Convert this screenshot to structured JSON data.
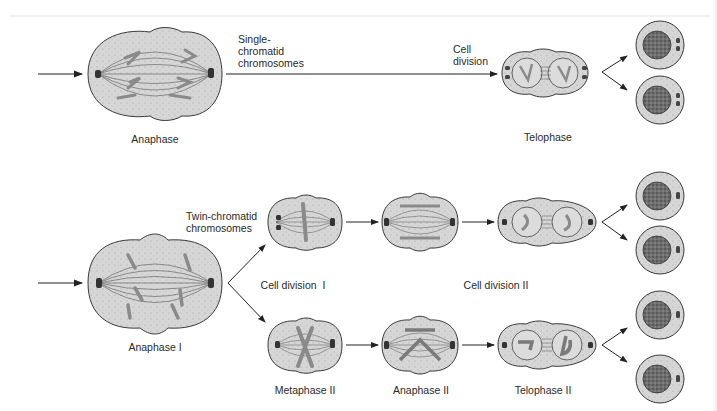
{
  "figure": {
    "colors": {
      "cytoplasm": "#d4d4d4",
      "outline": "#3a3a3a",
      "chromosome": "#8a8a8a",
      "nucleus": "#5a5a5a",
      "arrow": "#222222",
      "background": "#ffffff"
    }
  },
  "top_row": {
    "process": "Mitosis",
    "labels": {
      "anaphase": "Anaphase",
      "single_chromatid": "Single-\nchromatid\nchromosomes",
      "cell_division": "Cell\ndivision",
      "telophase": "Telophase"
    },
    "daughter_cells": 2
  },
  "bottom_row": {
    "process": "Meiosis",
    "labels": {
      "anaphase_i": "Anaphase I",
      "twin_chromatid": "Twin-chromatid\nchromosomes",
      "cell_division_i": "Cell division  I",
      "cell_division_ii": "Cell division II",
      "metaphase_ii": "Metaphase II",
      "anaphase_ii": "Anaphase II",
      "telophase_ii": "Telophase II"
    },
    "daughter_cells": 4
  }
}
